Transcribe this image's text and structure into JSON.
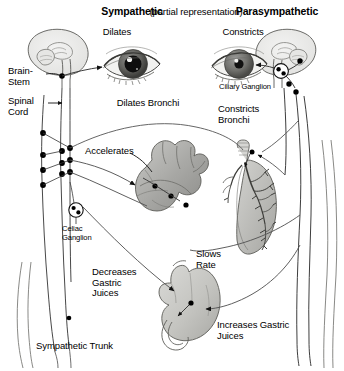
{
  "figure": {
    "title_left": "Sympathetic",
    "title_center": "(partial representation)",
    "title_right": "Parasympathetic"
  },
  "labels": {
    "dilates": "Dilates",
    "constricts": "Constricts",
    "brain_stem": "Brain-\nStem",
    "spinal_cord": "Spinal\nCord",
    "ciliary_ganglion": "Ciliary Ganglion",
    "dilates_bronchi": "Dilates Bronchi",
    "constricts_bronchi": "Constricts\nBronchi",
    "accelerates": "Accelerates",
    "slows_rate": "Slows\nRate",
    "celiac_ganglion": "Celiac\nGanglion",
    "decreases_gastric": "Decreases\nGastric\nJuices",
    "increases_gastric": "Increases Gastric\nJuices",
    "sympathetic_trunk": "Sympathetic Trunk"
  },
  "organs": {
    "brain_left": "brain-sagittal-left",
    "brain_right": "brain-sagittal-right",
    "eye_left": "eye-dilated-pupil",
    "eye_right": "eye-constricted-pupil",
    "heart": "heart",
    "lung": "lung-bronchial-tree",
    "stomach": "stomach"
  },
  "colors": {
    "ink": "#000000",
    "background": "#ffffff",
    "nerve": "#3a3a3a",
    "organ_fill_light": "#d8d8d6",
    "organ_fill_mid": "#b4b4b2",
    "organ_fill_dark": "#8e8e8c",
    "outline": "#4a4a4a"
  }
}
